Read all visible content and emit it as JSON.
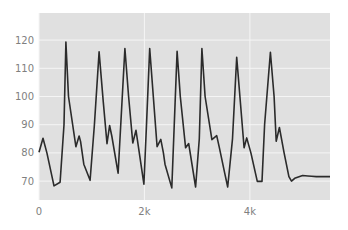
{
  "chart_data": {
    "type": "line",
    "title": "",
    "xlabel": "",
    "ylabel": "",
    "xlim": [
      0,
      5520
    ],
    "ylim": [
      63.3,
      129.6
    ],
    "grid": true,
    "legend": null,
    "x_ticks": [
      {
        "value": 0,
        "label": "0"
      },
      {
        "value": 2000,
        "label": "2k"
      },
      {
        "value": 4000,
        "label": "4k"
      }
    ],
    "y_ticks": [
      {
        "value": 70,
        "label": "70"
      },
      {
        "value": 80,
        "label": "80"
      },
      {
        "value": 90,
        "label": "90"
      },
      {
        "value": 100,
        "label": "100"
      },
      {
        "value": 110,
        "label": "110"
      },
      {
        "value": 120,
        "label": "120"
      }
    ],
    "colors": {
      "plot_bg": "#e0e0e0",
      "grid": "#f5f5f5",
      "line": "#2b2b2b",
      "tick_text": "#7f7f7f"
    },
    "series": [
      {
        "name": "signal",
        "x": [
          0,
          76,
          150,
          285,
          400,
          475,
          510,
          560,
          700,
          760,
          790,
          850,
          970,
          1050,
          1140,
          1220,
          1290,
          1340,
          1380,
          1500,
          1630,
          1700,
          1780,
          1840,
          1990,
          2040,
          2100,
          2240,
          2310,
          2360,
          2390,
          2520,
          2620,
          2680,
          2780,
          2840,
          2970,
          3040,
          3090,
          3150,
          3280,
          3370,
          3420,
          3520,
          3580,
          3670,
          3750,
          3890,
          3940,
          4020,
          4140,
          4230,
          4280,
          4390,
          4460,
          4500,
          4560,
          4650,
          4740,
          4790,
          4850,
          5000,
          5100,
          5170,
          5260,
          5520
        ],
        "values": [
          80.2,
          85.2,
          80,
          68.3,
          69.6,
          90,
          119.3,
          100,
          82.2,
          86,
          84,
          76,
          70.3,
          90,
          115.8,
          98,
          83.3,
          89.7,
          86,
          72.8,
          117,
          100,
          83.5,
          88,
          68.9,
          90,
          117,
          82.2,
          84.8,
          80,
          76,
          67.6,
          116,
          100,
          81.8,
          83.3,
          67.9,
          85,
          117,
          100,
          84.7,
          86.1,
          82,
          73,
          67.9,
          85,
          113.9,
          81.8,
          85.3,
          80,
          69.9,
          69.9,
          90,
          115.7,
          100,
          84.1,
          89,
          80,
          71.6,
          70,
          71,
          72,
          71.8,
          71.7,
          71.6,
          71.6
        ]
      }
    ]
  }
}
